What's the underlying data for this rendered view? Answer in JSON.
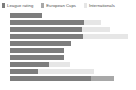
{
  "legend": {
    "position": "top-left",
    "items": [
      {
        "label": "League rating",
        "color": "#7d7d7d",
        "icon": "square-swatch-icon"
      },
      {
        "label": "European Cups",
        "color": "#a8a8a8",
        "icon": "square-swatch-icon"
      },
      {
        "label": "Internationals",
        "color": "#e6e6e6",
        "icon": "square-swatch-icon"
      }
    ]
  },
  "chart_data": {
    "type": "bar",
    "orientation": "horizontal",
    "stacked": true,
    "title": "",
    "subtitle": "",
    "xlabel": "",
    "ylabel": "",
    "grid": false,
    "legend_position": "top-left",
    "xlim": [
      0,
      120
    ],
    "categories": [
      "Bar 1",
      "Bar 2",
      "Bar 3",
      "Bar 4",
      "Bar 5",
      "Bar 6",
      "Bar 7",
      "Bar 8",
      "Bar 9",
      "Bar 10"
    ],
    "series": [
      {
        "name": "League rating",
        "color": "#7d7d7d",
        "values": [
          30,
          70,
          68,
          69,
          58,
          51,
          51,
          37,
          26,
          76
        ]
      },
      {
        "name": "European Cups",
        "color": "#a8a8a8",
        "values": [
          0,
          0,
          0,
          0,
          0,
          0,
          0,
          0,
          0,
          22
        ]
      },
      {
        "name": "Internationals",
        "color": "#e6e6e6",
        "values": [
          0,
          16,
          26,
          42,
          0,
          0,
          0,
          20,
          53,
          0
        ]
      }
    ],
    "totals": [
      30,
      86,
      94,
      111,
      58,
      51,
      51,
      57,
      79,
      98
    ]
  },
  "layout": {
    "plot_left_px": 10,
    "plot_top_px": 13,
    "bar_height_px": 5,
    "bar_pitch_px": 7,
    "px_per_unit": 1.06,
    "background": "#ffffff"
  }
}
